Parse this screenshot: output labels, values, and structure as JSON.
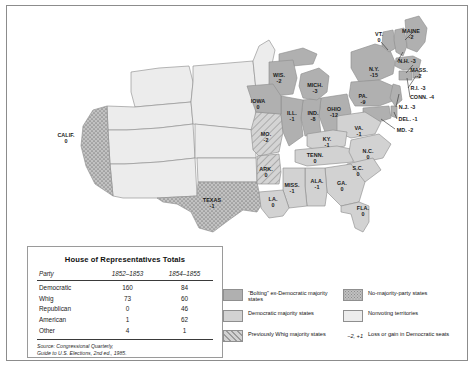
{
  "figure": {
    "width": 475,
    "height": 367
  },
  "table": {
    "title": "House of Representatives Totals",
    "columns": [
      "Party",
      "1852–1853",
      "1854–1855"
    ],
    "rows": [
      {
        "party": "Democratic",
        "c1852": "160",
        "c1854": "84"
      },
      {
        "party": "Whig",
        "c1852": "73",
        "c1854": "60"
      },
      {
        "party": "Republican",
        "c1852": "0",
        "c1854": "46"
      },
      {
        "party": "American",
        "c1852": "1",
        "c1854": "62"
      },
      {
        "party": "Other",
        "c1852": "4",
        "c1854": "1"
      }
    ],
    "source_line1": "Source: Congressional Quarterly,",
    "source_line2": "Guide to U.S. Elections, 2nd ed., 1985."
  },
  "legend": {
    "left": [
      {
        "pattern": "bolting",
        "label": "“Bolting” ex-Democratic majority states"
      },
      {
        "pattern": "democratic",
        "label": "Democratic majority states"
      },
      {
        "pattern": "whig",
        "label": "Previously Whig majority states"
      }
    ],
    "right": [
      {
        "pattern": "no-majority",
        "label": "No-majority-party states"
      },
      {
        "pattern": "nonvoting",
        "label": "Nonvoting territories"
      },
      {
        "pattern": "seat-note",
        "note": "−2, +1",
        "label": "Loss or gain in Democratic seats"
      }
    ]
  },
  "colors": {
    "bolting": "#b0b0b0",
    "democratic": "#d2d2d2",
    "whig_hatch_bg": "#d2d2d2",
    "whig_hatch_line": "#9a9a9a",
    "no_majority_bg": "#c0c0c0",
    "no_majority_dot": "#8d8d8d",
    "nonvoting": "#ececec",
    "border": "#8f8f8f",
    "water": "#ffffff"
  },
  "map": {
    "states": [
      {
        "name": "VT.",
        "value": "0",
        "x": 372,
        "y": 31,
        "layout": "stack"
      },
      {
        "name": "MAINE",
        "value": "-2",
        "x": 404,
        "y": 28,
        "layout": "stack"
      },
      {
        "name": "N.H.",
        "value": "-3",
        "x": 400,
        "y": 55,
        "layout": "inline"
      },
      {
        "name": "MASS.",
        "value": "-2",
        "x": 412,
        "y": 67,
        "layout": "stack"
      },
      {
        "name": "R.I.",
        "value": "-3",
        "x": 411,
        "y": 82,
        "layout": "inline"
      },
      {
        "name": "CONN.",
        "value": "-4",
        "x": 415,
        "y": 91,
        "layout": "inline"
      },
      {
        "name": "N.Y.",
        "value": "-15",
        "x": 367,
        "y": 66,
        "layout": "stack"
      },
      {
        "name": "N.J.",
        "value": "-3",
        "x": 400,
        "y": 101,
        "layout": "inline"
      },
      {
        "name": "DEL.",
        "value": "-1",
        "x": 401,
        "y": 113,
        "layout": "inline"
      },
      {
        "name": "MD.",
        "value": "-2",
        "x": 398,
        "y": 124,
        "layout": "inline"
      },
      {
        "name": "PA.",
        "value": "-9",
        "x": 356,
        "y": 93,
        "layout": "stack"
      },
      {
        "name": "WIS.",
        "value": "-2",
        "x": 272,
        "y": 72,
        "layout": "stack"
      },
      {
        "name": "MICH.",
        "value": "-3",
        "x": 308,
        "y": 82,
        "layout": "stack"
      },
      {
        "name": "OHIO",
        "value": "-12",
        "x": 327,
        "y": 106,
        "layout": "stack"
      },
      {
        "name": "ILL.",
        "value": "-1",
        "x": 285,
        "y": 110,
        "layout": "stack"
      },
      {
        "name": "IND.",
        "value": "-8",
        "x": 306,
        "y": 110,
        "layout": "stack"
      },
      {
        "name": "IOWA",
        "value": "0",
        "x": 251,
        "y": 98,
        "layout": "stack"
      },
      {
        "name": "MO.",
        "value": "-2",
        "x": 259,
        "y": 131,
        "layout": "stack"
      },
      {
        "name": "KY.",
        "value": "-1",
        "x": 320,
        "y": 136,
        "layout": "stack"
      },
      {
        "name": "VA.",
        "value": "-1",
        "x": 352,
        "y": 125,
        "layout": "stack"
      },
      {
        "name": "N.C.",
        "value": "0",
        "x": 361,
        "y": 148,
        "layout": "stack"
      },
      {
        "name": "TENN.",
        "value": "0",
        "x": 308,
        "y": 152,
        "layout": "stack"
      },
      {
        "name": "S.C.",
        "value": "0",
        "x": 351,
        "y": 165,
        "layout": "stack"
      },
      {
        "name": "ARK.",
        "value": "0",
        "x": 259,
        "y": 166,
        "layout": "stack"
      },
      {
        "name": "MISS.",
        "value": "-1",
        "x": 285,
        "y": 182,
        "layout": "stack"
      },
      {
        "name": "ALA.",
        "value": "-1",
        "x": 310,
        "y": 178,
        "layout": "stack"
      },
      {
        "name": "GA.",
        "value": "0",
        "x": 335,
        "y": 180,
        "layout": "stack"
      },
      {
        "name": "LA.",
        "value": "0",
        "x": 266,
        "y": 196,
        "layout": "stack"
      },
      {
        "name": "FLA.",
        "value": "0",
        "x": 356,
        "y": 205,
        "layout": "stack"
      },
      {
        "name": "TEXAS",
        "value": "-1",
        "x": 205,
        "y": 197,
        "layout": "stack"
      },
      {
        "name": "CALIF.",
        "value": "0",
        "x": 59,
        "y": 132,
        "layout": "stack"
      }
    ]
  }
}
